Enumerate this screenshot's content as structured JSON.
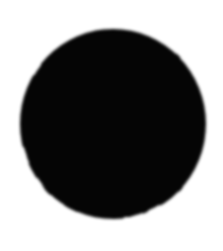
{
  "canvas": {
    "width": 223,
    "height": 251,
    "background_color": "#ffffff",
    "label": "black circle on white background"
  },
  "shape": {
    "name": "filled-circle",
    "type": "ellipse",
    "fill_color": "#050505",
    "stroke_color": "none",
    "center_x": 113,
    "center_y": 124,
    "radius_x": 93,
    "radius_y": 95,
    "bounds": {
      "left": 20,
      "top": 29,
      "right": 206,
      "bottom": 219,
      "width": 186,
      "height": 190
    },
    "edge_style": "soft anti-aliased",
    "edge_blur_px": 1.6,
    "opacity": 1
  },
  "annotations": {
    "visible_text": "",
    "labels": []
  }
}
